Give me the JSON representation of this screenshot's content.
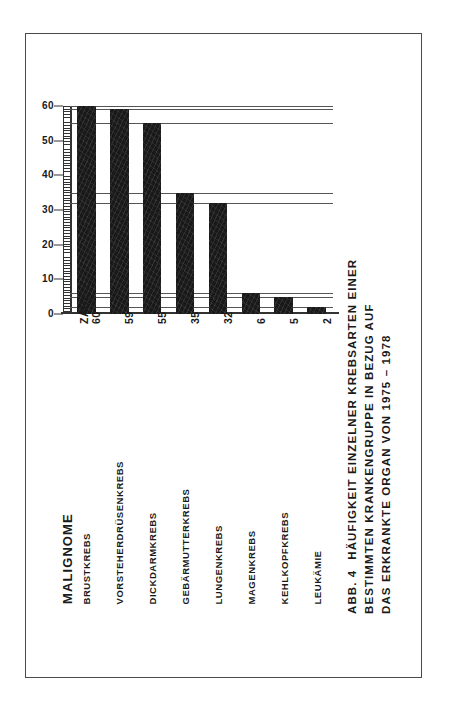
{
  "figure": {
    "caption_id": "ABB. 4",
    "caption_lines": [
      "HÄUFIGKEIT  EINZELNER  KREBSARTEN  EINER",
      "BESTIMMTEN KRANKENGRUPPE IN  BEZUG  AUF",
      "DAS  ERKRANKTE  ORGAN  VON   1975 – 1978"
    ],
    "row_header": "MALIGNOME",
    "value_header": "ZAHL"
  },
  "chart_data": {
    "type": "bar",
    "title": "HÄUFIGKEIT EINZELNER KREBSARTEN EINER BESTIMMTEN KRANKENGRUPPE IN BEZUG AUF DAS ERKRANKTE ORGAN VON 1975 – 1978",
    "xlabel": "MALIGNOME",
    "ylabel": "ZAHL",
    "ylim": [
      0,
      60
    ],
    "yticks": [
      0,
      10,
      20,
      30,
      40,
      50,
      60
    ],
    "ytick_labels": [
      "0",
      "10",
      "20",
      "30",
      "40",
      "50",
      "60"
    ],
    "grid": true,
    "legend": false,
    "categories": [
      "BRUSTKREBS",
      "VORSTEHERDRÜSENKREBS",
      "DICKDARMKREBS",
      "GEBÄRMUTTERKREBS",
      "LUNGENKREBS",
      "MAGENKREBS",
      "KEHLKOPFKREBS",
      "LEUKÄMIE"
    ],
    "values": [
      60,
      59,
      55,
      35,
      32,
      6,
      5,
      2
    ],
    "value_labels": [
      "60",
      "59",
      "55",
      "35",
      "32",
      "6",
      "5",
      "2"
    ],
    "colors": {
      "bar": "#191919",
      "axis": "#333333",
      "grid": "#555555",
      "frame": "#4a4a4a"
    }
  }
}
